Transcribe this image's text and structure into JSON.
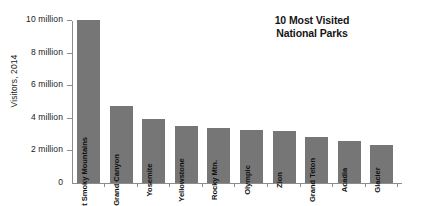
{
  "chart_data": {
    "type": "bar",
    "title": "10 Most Visited National Parks",
    "title_lines": [
      "10 Most Visited",
      "National Parks"
    ],
    "xlabel": "",
    "ylabel": "Visitors, 2014",
    "ylim": [
      0,
      10000000
    ],
    "grid": false,
    "legend": "none",
    "bar_color": "#767676",
    "axis_color": "#8c8c8c",
    "ytick_labels": [
      "0",
      "2 million",
      "4 million",
      "6 million",
      "8 million",
      "10 million"
    ],
    "ytick_values": [
      0,
      2000000,
      4000000,
      6000000,
      8000000,
      10000000
    ],
    "categories": [
      "Great Smoky Mountains",
      "Grand Canyon",
      "Yosemite",
      "Yellowstone",
      "Rocky Mtn.",
      "Olympic",
      "Zion",
      "Grand Teton",
      "Acadia",
      "Glacier"
    ],
    "values": [
      10000000,
      4750000,
      3900000,
      3500000,
      3400000,
      3250000,
      3200000,
      2800000,
      2550000,
      2350000
    ],
    "value_labels": [
      "10 million",
      "4.75 million",
      "3.9 million",
      "3.5 million",
      "3.4 million",
      "3.25 million",
      "3.2 million",
      "2.8 million",
      "2.55 million",
      "2.35 million"
    ]
  }
}
